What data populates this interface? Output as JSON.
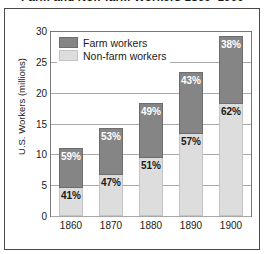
{
  "chart_data": {
    "type": "bar",
    "subtype": "stacked-bar-percent",
    "title": "Farm and Non-farm Workers 1860–1900",
    "xlabel": "",
    "ylabel": "U.S. Workers (millions)",
    "ylim": [
      0,
      30
    ],
    "yticks": [
      0,
      5,
      10,
      15,
      20,
      25,
      30
    ],
    "ytick_labels": [
      "0",
      "5",
      "10",
      "15",
      "20",
      "25",
      "30"
    ],
    "grid": true,
    "legend_position": "top-left-inside",
    "categories": [
      "1860",
      "1870",
      "1880",
      "1890",
      "1900"
    ],
    "series": [
      {
        "name": "Farm workers",
        "color": "#858585",
        "percent_labels": [
          "59%",
          "53%",
          "49%",
          "43%",
          "38%"
        ],
        "percents": [
          59,
          53,
          49,
          43,
          38
        ],
        "values": [
          6.5,
          7.5,
          9.0,
          10.1,
          11.1
        ]
      },
      {
        "name": "Non-farm workers",
        "color": "#dddddd",
        "percent_labels": [
          "41%",
          "47%",
          "51%",
          "57%",
          "62%"
        ],
        "percents": [
          41,
          47,
          51,
          57,
          62
        ],
        "values": [
          4.5,
          6.7,
          9.4,
          13.3,
          18.1
        ]
      }
    ],
    "totals": [
      11.0,
      14.2,
      18.4,
      23.4,
      29.2
    ]
  },
  "colors": {
    "farm": "#858585",
    "nonfarm": "#dddddd",
    "text": "#1a1a1a",
    "gridline": "#a8a8a8",
    "frame": "#4a4a4a"
  }
}
